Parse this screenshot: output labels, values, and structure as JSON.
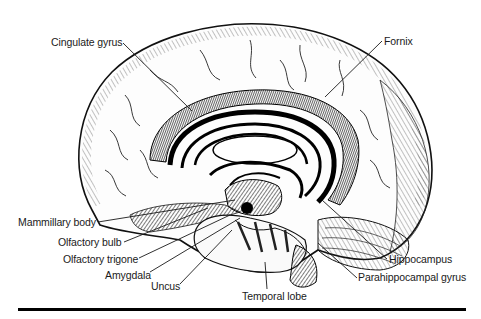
{
  "figure": {
    "style": "black-and-white engraving illustration",
    "colors": {
      "ink": "#111111",
      "background": "#ffffff",
      "label_text": "#1a1a1a"
    },
    "labels": [
      {
        "id": "cingulate-gyrus",
        "text": "Cingulate gyrus"
      },
      {
        "id": "fornix",
        "text": "Fornix"
      },
      {
        "id": "mammillary-body",
        "text": "Mammillary body"
      },
      {
        "id": "olfactory-bulb",
        "text": "Olfactory bulb"
      },
      {
        "id": "olfactory-trigone",
        "text": "Olfactory trigone"
      },
      {
        "id": "amygdala",
        "text": "Amygdala"
      },
      {
        "id": "uncus",
        "text": "Uncus"
      },
      {
        "id": "temporal-lobe",
        "text": "Temporal lobe"
      },
      {
        "id": "hippocampus",
        "text": "Hippocampus"
      },
      {
        "id": "parahippocampal-gyrus",
        "text": "Parahippocampal gyrus"
      }
    ]
  }
}
